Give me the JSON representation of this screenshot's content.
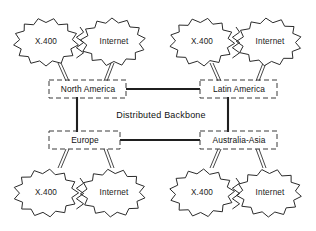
{
  "diagram": {
    "title": "Distributed Backbone",
    "center_label": "Distributed Backbone",
    "regions": [
      {
        "id": "north-america",
        "label": "North America",
        "x": 87,
        "y": 89
      },
      {
        "id": "latin-america",
        "label": "Latin America",
        "x": 239,
        "y": 89
      },
      {
        "id": "europe",
        "label": "Europe",
        "x": 87,
        "y": 140
      },
      {
        "id": "australia-asia",
        "label": "Australia-Asia",
        "x": 239,
        "y": 140
      }
    ],
    "clouds": [
      {
        "id": "top-left-x400",
        "label": "X.400",
        "cx": 46,
        "cy": 42
      },
      {
        "id": "top-left-internet",
        "label": "Internet",
        "cx": 113,
        "cy": 42
      },
      {
        "id": "top-right-x400",
        "label": "X.400",
        "cx": 202,
        "cy": 42
      },
      {
        "id": "top-right-internet",
        "label": "Internet",
        "cx": 269,
        "cy": 42
      },
      {
        "id": "bottom-left-x400",
        "label": "X.400",
        "cx": 46,
        "cy": 193
      },
      {
        "id": "bottom-left-internet",
        "label": "Internet",
        "cx": 113,
        "cy": 193
      },
      {
        "id": "bottom-right-x400",
        "label": "X.400",
        "cx": 202,
        "cy": 193
      },
      {
        "id": "bottom-right-internet",
        "label": "Internet",
        "cx": 269,
        "cy": 193
      }
    ],
    "colors": {
      "background": "#ffffff",
      "stroke": "#2b2b2b",
      "trunk": "#1f1f1f",
      "dashed_box": "#3a3a3a",
      "text": "#111111"
    },
    "links": [
      {
        "from": "north-america",
        "to": "latin-america",
        "style": "trunk-horizontal"
      },
      {
        "from": "europe",
        "to": "australia-asia",
        "style": "trunk-horizontal"
      },
      {
        "from": "north-america",
        "to": "europe",
        "style": "trunk-vertical"
      },
      {
        "from": "latin-america",
        "to": "australia-asia",
        "style": "trunk-vertical"
      }
    ]
  }
}
